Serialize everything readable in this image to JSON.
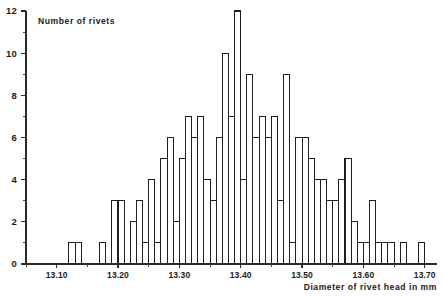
{
  "chart_data": {
    "type": "bar",
    "title": "",
    "ylabel": "Number of rivets",
    "xlabel": "Diameter of rivet head in mm",
    "bin_width": 0.01,
    "xlim": [
      13.05,
      13.72
    ],
    "ylim": [
      0,
      12
    ],
    "grid": false,
    "legend": null,
    "y_tick_labels": [
      "0",
      "2",
      "4",
      "6",
      "8",
      "10",
      "12"
    ],
    "y_tick_values": [
      0,
      2,
      4,
      6,
      8,
      10,
      12
    ],
    "y_minor_tick_values": [
      1,
      3,
      5,
      7,
      9,
      11
    ],
    "x_tick_labels": [
      "13.10",
      "13.20",
      "13.30",
      "13.40",
      "13.50",
      "13.60",
      "13.70"
    ],
    "x_tick_values": [
      13.1,
      13.2,
      13.3,
      13.4,
      13.5,
      13.6,
      13.7
    ],
    "categories": [
      "13.12",
      "13.13",
      "13.17",
      "13.19",
      "13.20",
      "13.22",
      "13.23",
      "13.24",
      "13.25",
      "13.26",
      "13.27",
      "13.28",
      "13.29",
      "13.30",
      "13.31",
      "13.32",
      "13.33",
      "13.34",
      "13.35",
      "13.36",
      "13.37",
      "13.38",
      "13.39",
      "13.40",
      "13.41",
      "13.42",
      "13.43",
      "13.44",
      "13.45",
      "13.46",
      "13.47",
      "13.48",
      "13.49",
      "13.50",
      "13.51",
      "13.52",
      "13.53",
      "13.54",
      "13.55",
      "13.56",
      "13.57",
      "13.58",
      "13.59",
      "13.60",
      "13.61",
      "13.62",
      "13.63",
      "13.64",
      "13.66",
      "13.69"
    ],
    "values": [
      1,
      1,
      1,
      3,
      3,
      2,
      3,
      1,
      4,
      1,
      5,
      6,
      2,
      5,
      7,
      6,
      7,
      4,
      3,
      6,
      10,
      7,
      12,
      4,
      9,
      6,
      7,
      6,
      7,
      3,
      9,
      1,
      6,
      6,
      5,
      4,
      4,
      3,
      3,
      4,
      5,
      2,
      1,
      1,
      3,
      1,
      1,
      1,
      1,
      1
    ],
    "x_axis_line_color": "#2b2b2b",
    "bar_fill": "#ffffff",
    "bar_stroke": "#1f1f1f"
  }
}
